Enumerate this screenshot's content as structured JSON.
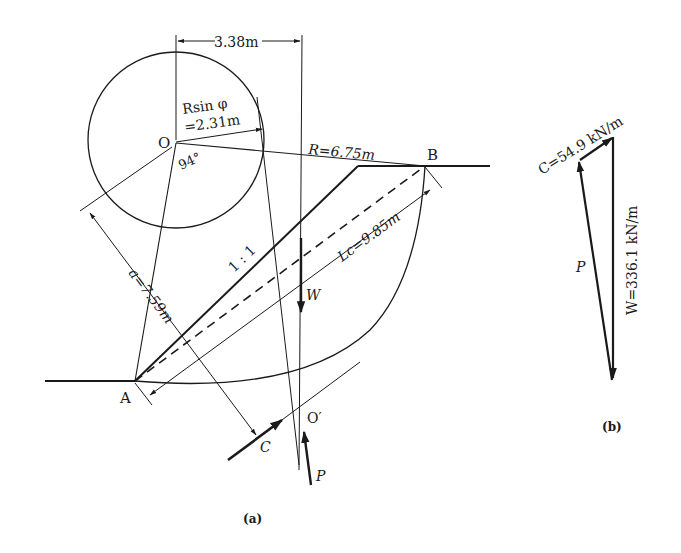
{
  "figure_a": {
    "caption": "(a)",
    "points": {
      "O": "O",
      "O_prime": "O′",
      "A": "A",
      "B": "B"
    },
    "dimensions": {
      "horizontal_offset": "3.38m",
      "rsinphi_line1": "Rsin φ",
      "rsinphi_line2": "=2.31m",
      "radius": "R=6.75m",
      "angle": "94°",
      "lever_arm": "a=7.59m",
      "chord_length": "Lc=9.85m",
      "slope_ratio": "1 : 1"
    },
    "forces": {
      "weight": "W",
      "cohesion": "C",
      "reaction": "P"
    }
  },
  "figure_b": {
    "caption": "(b)",
    "cohesion_force": "C=54.9 kN/m",
    "weight_force": "W=336.1 kN/m",
    "reaction_force": "P"
  },
  "colors": {
    "line": "#1a1a1a",
    "background": "#ffffff"
  }
}
